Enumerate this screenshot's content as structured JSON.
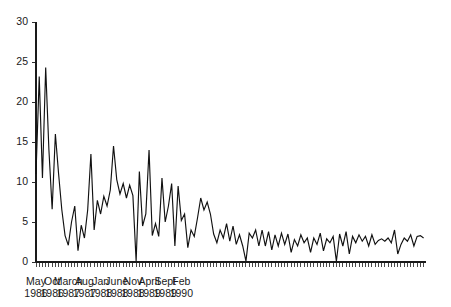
{
  "chart_data": {
    "type": "line",
    "title": "",
    "subtitle": "",
    "xlabel": "",
    "ylabel": "",
    "ylim": [
      0,
      30
    ],
    "yticks": [
      0,
      5,
      10,
      15,
      20,
      25,
      30
    ],
    "ytick_labels": [
      "0",
      "5",
      "10",
      "15",
      "20",
      "25",
      "30"
    ],
    "grid": false,
    "legend": null,
    "legend_position": "none",
    "x_axis_type": "monthly-time-series",
    "x_start": "May 1986",
    "x_end": "June 1990",
    "x_tick_interval_months": 1,
    "x_label_interval_months": 5,
    "xtick_labels": [
      {
        "index": 0,
        "month": "May",
        "year": "1986"
      },
      {
        "index": 5,
        "month": "Oct",
        "year": "1986"
      },
      {
        "index": 10,
        "month": "March",
        "year": "1987"
      },
      {
        "index": 15,
        "month": "Aug",
        "year": "1987"
      },
      {
        "index": 20,
        "month": "Jan",
        "year": "1988"
      },
      {
        "index": 25,
        "month": "June",
        "year": "1988"
      },
      {
        "index": 30,
        "month": "Nov",
        "year": "1988"
      },
      {
        "index": 35,
        "month": "April",
        "year": "1989"
      },
      {
        "index": 40,
        "month": "Sept",
        "year": "1989"
      },
      {
        "index": 45,
        "month": "Feb",
        "year": "1990"
      }
    ],
    "x": [
      "May 1986",
      "Jun 1986",
      "Jul 1986",
      "Aug 1986",
      "Sep 1986",
      "Oct 1986",
      "Nov 1986",
      "Dec 1986",
      "Jan 1987",
      "Feb 1987",
      "Mar 1987",
      "Apr 1987",
      "May 1987",
      "Jun 1987",
      "Jul 1987",
      "Aug 1987",
      "Sep 1987",
      "Oct 1987",
      "Nov 1987",
      "Dec 1987",
      "Jan 1988",
      "Feb 1988",
      "Mar 1988",
      "Apr 1988",
      "May 1988",
      "Jun 1988",
      "Jul 1988",
      "Aug 1988",
      "Sep 1988",
      "Oct 1988",
      "Nov 1988",
      "Dec 1988",
      "Jan 1989",
      "Feb 1989",
      "Mar 1989",
      "Apr 1989",
      "May 1989",
      "Jun 1989",
      "Jul 1989",
      "Aug 1989",
      "Sep 1989",
      "Oct 1989",
      "Nov 1989",
      "Dec 1989",
      "Jan 1990",
      "Feb 1990",
      "Mar 1990",
      "Apr 1990",
      "May 1990",
      "Jun 1990"
    ],
    "values": [
      11.0,
      23.2,
      10.5,
      24.3,
      14.0,
      6.6,
      16.0,
      11.0,
      6.5,
      3.3,
      2.1,
      5.0,
      7.0,
      1.4,
      4.6,
      3.0,
      6.5,
      13.5,
      4.0,
      7.7,
      6.0,
      8.2,
      7.0,
      9.0,
      14.5,
      10.3,
      8.5,
      9.8,
      8.0,
      9.6,
      8.3,
      0.1,
      11.3,
      4.5,
      6.0,
      14.0,
      3.3,
      4.8,
      3.2,
      10.5,
      5.0,
      7.0,
      9.8,
      2.0,
      9.5,
      5.2,
      6.0,
      1.8,
      4.0,
      3.2
    ],
    "values_full_monthly": [
      11.0,
      23.2,
      10.5,
      24.3,
      14.0,
      6.6,
      16.0,
      11.0,
      6.5,
      3.3,
      2.1,
      5.0,
      7.0,
      1.4,
      4.6,
      3.0,
      6.5,
      13.5,
      4.0,
      7.7,
      6.0,
      8.2,
      7.0,
      9.0,
      14.5,
      10.3,
      8.5,
      9.8,
      8.0,
      9.6,
      8.3,
      0.1,
      11.3,
      4.5,
      6.0,
      14.0,
      3.3,
      4.8,
      3.2,
      10.5,
      5.0,
      7.0,
      9.8,
      2.0,
      9.5,
      5.2,
      6.0,
      1.8,
      4.0,
      3.2,
      5.5,
      8.0,
      6.5,
      7.5,
      6.0,
      3.5,
      2.4,
      4.0,
      3.0,
      4.8,
      2.6,
      4.5,
      2.2,
      3.4,
      2.0,
      0.1,
      3.6,
      3.0,
      4.0,
      2.0,
      4.0,
      2.0,
      3.8,
      1.5,
      3.4,
      2.0,
      3.6,
      2.2,
      3.5,
      1.2,
      2.8,
      2.0,
      3.4,
      2.4,
      3.0,
      1.2,
      3.0,
      2.2,
      3.6,
      1.4,
      2.9,
      2.4,
      3.2,
      0.1,
      3.5,
      2.0,
      3.8,
      1.0,
      3.2,
      2.4,
      3.4,
      2.6,
      3.2,
      2.0,
      3.4,
      2.2,
      2.7,
      2.9,
      2.6,
      3.0,
      2.4,
      4.0,
      1.0,
      2.2,
      3.0,
      2.6,
      3.4,
      2.0,
      3.2,
      3.3,
      3.0
    ]
  },
  "axis": {
    "y_max_label": "30",
    "y_min_label": "0"
  }
}
